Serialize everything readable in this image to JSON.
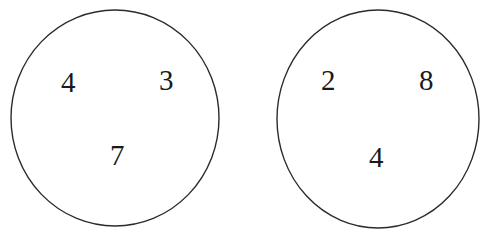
{
  "figure": {
    "type": "number-circles-diagram",
    "background_color": "#ffffff",
    "stroke_color": "#2b2b2b",
    "stroke_width": 1.4,
    "text_color": "#1a1a1a",
    "groups": [
      {
        "name": "left-circle",
        "cx": 115,
        "cy": 118,
        "rx": 104,
        "ry": 108,
        "numbers": [
          {
            "value": "4",
            "x": 61,
            "y": 68
          },
          {
            "value": "3",
            "x": 159,
            "y": 66
          },
          {
            "value": "7",
            "x": 110,
            "y": 141
          }
        ]
      },
      {
        "name": "right-circle",
        "cx": 378,
        "cy": 119,
        "rx": 101,
        "ry": 109,
        "numbers": [
          {
            "value": "2",
            "x": 321,
            "y": 66
          },
          {
            "value": "8",
            "x": 419,
            "y": 66
          },
          {
            "value": "4",
            "x": 369,
            "y": 143
          }
        ]
      }
    ]
  }
}
